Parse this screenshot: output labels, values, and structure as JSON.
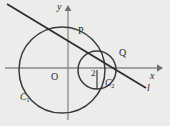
{
  "figure": {
    "background_color": "#ececea",
    "ink_color": "#2b2b2b",
    "axis_color": "#8a8a8a",
    "width": 170,
    "height": 126
  },
  "axes": {
    "x_label": "x",
    "y_label": "y",
    "origin_label": "O",
    "x_axis": {
      "x1": 5,
      "y1": 68,
      "x2": 160,
      "y2": 68
    },
    "y_axis": {
      "x1": 68,
      "y1": 120,
      "x2": 68,
      "y2": 8
    }
  },
  "circles": [
    {
      "name": "C1",
      "label": "C",
      "subscript": "1",
      "cx": 62,
      "cy": 70,
      "r": 43
    },
    {
      "name": "C2",
      "label": "C",
      "subscript": "2",
      "cx": 97,
      "cy": 70,
      "r": 19
    }
  ],
  "line": {
    "name": "l",
    "label": "l",
    "x1": 7,
    "y1": 4,
    "x2": 146,
    "y2": 88
  },
  "points": [
    {
      "name": "P",
      "label": "P",
      "x": 80,
      "y": 31
    },
    {
      "name": "Q",
      "label": "Q",
      "x": 121,
      "y": 53
    }
  ],
  "measurements": [
    {
      "name": "radius-2",
      "label": "2",
      "x": 94,
      "y": 70
    }
  ]
}
